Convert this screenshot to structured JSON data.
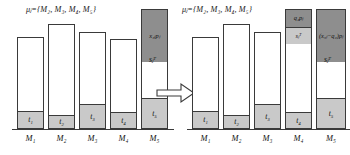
{
  "figure": {
    "type": "stacked-bar-transformation-diagram",
    "panels": 2,
    "machines": [
      "M1",
      "M2",
      "M3",
      "M4",
      "M5"
    ],
    "arrow": {
      "name": "transformation-arrow",
      "direction": "right",
      "style": "hollow-outline"
    }
  },
  "left_panel": {
    "set_label": {
      "text": "μⱼ={M₂, M₃, M₄, M₅}",
      "mu": "μ",
      "mu_sub": "j",
      "eq": "={",
      "members": [
        "M2",
        "M3",
        "M4",
        "M5"
      ],
      "close": "}"
    },
    "axis_labels": [
      "M₁",
      "M₂",
      "M₃",
      "M₄",
      "M₅"
    ],
    "bars": [
      {
        "machine": "M₁",
        "base_label": "t₁",
        "base_label_main": "t",
        "base_label_sub": "1",
        "total_height": 92,
        "base_height": 17,
        "dark_height": 0,
        "dark_label": ""
      },
      {
        "machine": "M₂",
        "base_label": "t₂",
        "base_label_main": "t",
        "base_label_sub": "2",
        "total_height": 105,
        "base_height": 13,
        "dark_height": 0,
        "dark_label": ""
      },
      {
        "machine": "M₃",
        "base_label": "t₃",
        "base_label_main": "t",
        "base_label_sub": "3",
        "total_height": 97,
        "base_height": 24,
        "dark_height": 0,
        "dark_label": ""
      },
      {
        "machine": "M₄",
        "base_label": "t₄",
        "base_label_main": "t",
        "base_label_sub": "4",
        "total_height": 90,
        "base_height": 16,
        "dark_height": 0,
        "dark_label": ""
      },
      {
        "machine": "M₅",
        "base_label": "t₅",
        "base_label_main": "t",
        "base_label_sub": "5",
        "total_height": 128,
        "base_height": 30,
        "dark_height": 52,
        "dark_label": "x₅ⱼpⱼ"
      }
    ],
    "annotations": {
      "top_block": {
        "main": "x",
        "sub": "5j",
        "tail": "p",
        "tail_sub": "j",
        "full": "x₅ⱼpⱼ"
      },
      "slack": {
        "main": "s",
        "sub": "j",
        "sup": "T",
        "full": "sⱼᵀ"
      }
    }
  },
  "right_panel": {
    "set_label": {
      "text": "μⱼ={M₂, M₃, M₄, M₅}",
      "mu": "μ",
      "mu_sub": "j",
      "eq": "={",
      "members": [
        "M2",
        "M3",
        "M4",
        "M5"
      ],
      "close": "}"
    },
    "axis_labels": [
      "M₁",
      "M₂",
      "M₃",
      "M₄",
      "M₅"
    ],
    "bars": [
      {
        "machine": "M₁",
        "base_label": "t₁",
        "base_label_main": "t",
        "base_label_sub": "1",
        "total_height": 92,
        "base_height": 17,
        "dark_height": 0,
        "dark_label": ""
      },
      {
        "machine": "M₂",
        "base_label": "t₂",
        "base_label_main": "t",
        "base_label_sub": "2",
        "total_height": 105,
        "base_height": 13,
        "dark_height": 0,
        "dark_label": ""
      },
      {
        "machine": "M₃",
        "base_label": "t₃",
        "base_label_main": "t",
        "base_label_sub": "3",
        "total_height": 97,
        "base_height": 24,
        "dark_height": 0,
        "dark_label": ""
      },
      {
        "machine": "M₄",
        "base_label": "t₄",
        "base_label_main": "t",
        "base_label_sub": "4",
        "total_height": 128,
        "base_height": 16,
        "dark_height": 17,
        "dark_label": "q₂pⱼ",
        "slack_segment_label": "sⱼᵀ",
        "slack_segment_height": 17
      },
      {
        "machine": "M₅",
        "base_label": "t₅",
        "base_label_main": "t",
        "base_label_sub": "5",
        "total_height": 128,
        "base_height": 30,
        "dark_height": 52,
        "dark_label": "(x₅ⱼ−q₂)pⱼ"
      }
    ],
    "annotations": {
      "m4_top_block": {
        "main": "q",
        "sub": "2",
        "tail": "p",
        "tail_sub": "j",
        "full": "q₂pⱼ"
      },
      "m4_slack_block": {
        "main": "s",
        "sub": "j",
        "sup": "T",
        "full": "sⱼᵀ"
      },
      "m5_top_block": {
        "full": "(x₅ⱼ−q₂)pⱼ",
        "open": "(x",
        "sub1": "5j",
        "minus": "−q",
        "sub2": "2",
        "close": ")p",
        "sub3": "j"
      },
      "slack": {
        "main": "s",
        "sub": "j",
        "sup": "T",
        "full": "sⱼᵀ"
      }
    }
  },
  "colors": {
    "background": "#ffffff",
    "bar_outline": "#3a3a3a",
    "bar_fill_empty": "#ffffff",
    "segment_light_gray": "#c9c9c9",
    "segment_dark_gray": "#8e8e8e",
    "text": "#111111"
  }
}
